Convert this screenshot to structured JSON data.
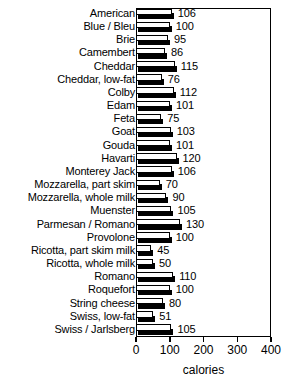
{
  "chart_data": {
    "type": "bar",
    "orientation": "horizontal",
    "title": "",
    "xlabel": "calories",
    "ylabel": "",
    "xlim": [
      0,
      400
    ],
    "xticks": [
      0,
      100,
      200,
      300,
      400
    ],
    "xtick_labels": [
      "0",
      "100",
      "200",
      "300",
      "400"
    ],
    "grid": false,
    "legend": false,
    "bar_style": "white-fill-black-outline-with-black-drop-shadow",
    "categories": [
      "American",
      "Blue / Bleu",
      "Brie",
      "Camembert",
      "Cheddar",
      "Cheddar, low-fat",
      "Colby",
      "Edam",
      "Feta",
      "Goat",
      "Gouda",
      "Havarti",
      "Monterey Jack",
      "Mozzarella, part skim",
      "Mozzarella, whole milk",
      "Muenster",
      "Parmesan / Romano",
      "Provolone",
      "Ricotta, part skim milk",
      "Ricotta, whole milk",
      "Romano",
      "Roquefort",
      "String cheese",
      "Swiss, low-fat",
      "Swiss / Jarlsberg"
    ],
    "values": [
      106,
      100,
      95,
      86,
      115,
      76,
      112,
      101,
      75,
      103,
      101,
      120,
      106,
      70,
      90,
      105,
      130,
      100,
      45,
      50,
      110,
      100,
      80,
      51,
      105
    ],
    "value_labels": [
      "106",
      "100",
      "95",
      "86",
      "115",
      "76",
      "112",
      "101",
      "75",
      "103",
      "101",
      "120",
      "106",
      "70",
      "90",
      "105",
      "130",
      "100",
      "45",
      "50",
      "110",
      "100",
      "80",
      "51",
      "105"
    ]
  },
  "colors": {
    "bar_fill": "#ffffff",
    "bar_outline": "#000000",
    "bar_shadow": "#000000",
    "axis": "#000000",
    "text": "#000000",
    "background": "#ffffff"
  }
}
